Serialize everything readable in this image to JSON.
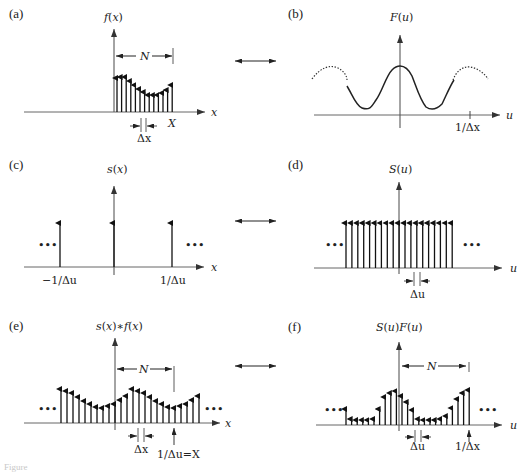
{
  "figure": {
    "panels": [
      {
        "id": "a",
        "label": "(a)",
        "ylabel": "f(x)",
        "xlabel": "x",
        "annotations": [
          "N",
          "X",
          "Δx"
        ]
      },
      {
        "id": "b",
        "label": "(b)",
        "ylabel": "F(u)",
        "xlabel": "u",
        "annotations": [
          "1/Δx"
        ]
      },
      {
        "id": "c",
        "label": "(c)",
        "ylabel": "s(x)",
        "xlabel": "x",
        "annotations": [
          "−1/Δu",
          "1/Δu",
          "•••",
          "•••"
        ]
      },
      {
        "id": "d",
        "label": "(d)",
        "ylabel": "S(u)",
        "xlabel": "u",
        "annotations": [
          "Δu",
          "•••",
          "•••"
        ]
      },
      {
        "id": "e",
        "label": "(e)",
        "ylabel": "s(x)∗f(x)",
        "xlabel": "x",
        "annotations": [
          "N",
          "Δx",
          "1/Δu=X",
          "•••",
          "•••"
        ]
      },
      {
        "id": "f",
        "label": "(f)",
        "ylabel": "S(u)F(u)",
        "xlabel": "u",
        "annotations": [
          "N",
          "Δu",
          "1/Δx",
          "•••",
          "•••"
        ]
      }
    ],
    "relations": [
      "↔",
      "↔",
      "↔"
    ],
    "caption": "Figure"
  },
  "text": {
    "a_label": "(a)",
    "a_y": "f(x)",
    "a_x": "x",
    "a_N": "N",
    "a_X": "X",
    "a_dx": "Δx",
    "b_label": "(b)",
    "b_y": "F(u)",
    "b_x": "u",
    "b_tick": "1/Δx",
    "c_label": "(c)",
    "c_y": "s(x)",
    "c_x": "x",
    "c_tl": "−1/Δu",
    "c_tr": "1/Δu",
    "dots": "•••",
    "d_label": "(d)",
    "d_y": "S(u)",
    "d_x": "u",
    "d_du": "Δu",
    "e_label": "(e)",
    "e_y": "s(x)∗f(x)",
    "e_x": "x",
    "e_N": "N",
    "e_dx": "Δx",
    "e_tick": "1/Δu=X",
    "f_label": "(f)",
    "f_y": "S(u)F(u)",
    "f_x": "u",
    "f_N": "N",
    "f_du": "Δu",
    "f_tick": "1/Δx"
  },
  "samples": {
    "a_heights": [
      34,
      35,
      35,
      31,
      27,
      23,
      20,
      17,
      17,
      17,
      19,
      22,
      27
    ],
    "f_heights": [
      16,
      6,
      5,
      5,
      5,
      6,
      16,
      28,
      32,
      34,
      29,
      23,
      15,
      6,
      5,
      5,
      5,
      6,
      9,
      17,
      26,
      32,
      35
    ]
  }
}
